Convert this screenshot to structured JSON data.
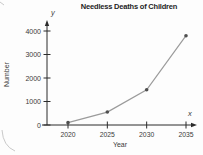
{
  "chart": {
    "title": "Needless Deaths of Children",
    "xlabel": "Year",
    "ylabel": "Number",
    "x_axis_letter": "x",
    "y_axis_letter": "y"
  },
  "chart_data": {
    "type": "line",
    "title": "Needless Deaths of Children",
    "xlabel": "Year",
    "ylabel": "Number",
    "x": [
      2020,
      2025,
      2030,
      2035
    ],
    "values": [
      100,
      550,
      1500,
      3800
    ],
    "xticks": [
      2020,
      2025,
      2030,
      2035
    ],
    "yticks": [
      0,
      1000,
      2000,
      3000,
      4000
    ],
    "xlim": [
      2020,
      2035
    ],
    "ylim": [
      0,
      4000
    ],
    "grid": false,
    "legend": "none",
    "colors": {
      "line": "#9b9b9b",
      "marker": "#4f4f4f",
      "axis": "#2b2b2b",
      "tick_text": "#3a3a3a",
      "artifact": "#c9c9c9"
    }
  }
}
